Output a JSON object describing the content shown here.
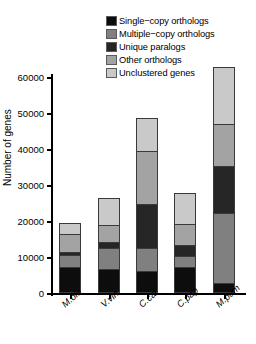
{
  "chart_data": {
    "type": "bar",
    "subtype": "stacked-bar",
    "title": "",
    "xlabel": "",
    "ylabel": "Number of genes",
    "ylim": [
      0,
      60000
    ],
    "yticks": [
      0,
      10000,
      20000,
      30000,
      40000,
      50000,
      60000
    ],
    "ytick_labels": [
      "0",
      "10000",
      "20000",
      "30000",
      "40000",
      "50000",
      "60000"
    ],
    "grid": false,
    "legend_position": "top-right",
    "categories": [
      "M.ole",
      "V.vin",
      "C.cal",
      "C.pap",
      "M.pum"
    ],
    "series": [
      {
        "name": "Single-copy orthologs",
        "color": "#0d0d0d",
        "values": [
          7300,
          6800,
          6000,
          7200,
          2700
        ]
      },
      {
        "name": "Multiple-copy orthologs",
        "color": "#808080",
        "values": [
          3200,
          5700,
          6500,
          3000,
          19500
        ]
      },
      {
        "name": "Unique paralogs",
        "color": "#262626",
        "values": [
          800,
          1600,
          12300,
          3200,
          13200
        ]
      },
      {
        "name": "Other orthologs",
        "color": "#a3a3a3",
        "values": [
          5200,
          4900,
          14700,
          5900,
          11500
        ]
      },
      {
        "name": "Unclustered genes",
        "color": "#c9c9c9",
        "values": [
          3000,
          7300,
          9000,
          8500,
          15900
        ]
      }
    ],
    "totals": [
      19500,
      26300,
      48500,
      27800,
      62800
    ]
  },
  "legend": {
    "items": [
      {
        "label": "Single−copy orthologs",
        "color": "#0d0d0d"
      },
      {
        "label": "Multiple−copy orthologs",
        "color": "#808080"
      },
      {
        "label": "Unique paralogs",
        "color": "#262626"
      },
      {
        "label": "Other orthologs",
        "color": "#a3a3a3"
      },
      {
        "label": "Unclustered genes",
        "color": "#c9c9c9"
      }
    ]
  },
  "axes": {
    "y_title": "Number of genes",
    "y_tick_labels": [
      "60000",
      "50000",
      "40000",
      "30000",
      "20000",
      "10000",
      "0"
    ],
    "x_tick_labels": [
      "M.ole",
      "V.vin",
      "C.cal",
      "C.pap",
      "M.pum"
    ]
  }
}
